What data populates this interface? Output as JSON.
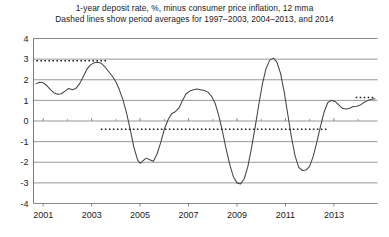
{
  "chart_data": {
    "type": "line",
    "title": "1-year deposit rate, %, minus consumer price inflation, 12 mma",
    "subtitle": "Dashed lines show period averages for 1997–2003,  2004–2013,  and 2014",
    "xlabel": "",
    "ylabel": "",
    "xlim": [
      2000.6,
      2014.8
    ],
    "ylim": [
      -4,
      4
    ],
    "grid": true,
    "legend": "none",
    "yticks": [
      "4",
      "3",
      "2",
      "1",
      "0",
      "-1",
      "-2",
      "-3",
      "-4"
    ],
    "ytick_values": [
      4,
      3,
      2,
      1,
      0,
      -1,
      -2,
      -3,
      -4
    ],
    "xticks": [
      "2001",
      "2003",
      "2005",
      "2007",
      "2009",
      "2011",
      "2013"
    ],
    "xtick_values": [
      2001,
      2003,
      2005,
      2007,
      2009,
      2011,
      2013
    ],
    "series": [
      {
        "name": "1-year deposit rate minus CPI inflation, 12 mma",
        "style": "solid",
        "color": "#444444",
        "x": [
          2000.7,
          2000.85,
          2001.0,
          2001.15,
          2001.3,
          2001.45,
          2001.6,
          2001.75,
          2001.9,
          2002.05,
          2002.2,
          2002.35,
          2002.5,
          2002.65,
          2002.8,
          2002.95,
          2003.1,
          2003.25,
          2003.4,
          2003.55,
          2003.7,
          2003.85,
          2004.0,
          2004.15,
          2004.3,
          2004.45,
          2004.6,
          2004.75,
          2004.9,
          2005.0,
          2005.1,
          2005.25,
          2005.4,
          2005.55,
          2005.7,
          2005.85,
          2006.0,
          2006.15,
          2006.3,
          2006.45,
          2006.6,
          2006.75,
          2006.9,
          2007.05,
          2007.2,
          2007.35,
          2007.5,
          2007.65,
          2007.8,
          2007.95,
          2008.1,
          2008.25,
          2008.4,
          2008.55,
          2008.7,
          2008.85,
          2009.0,
          2009.15,
          2009.3,
          2009.45,
          2009.6,
          2009.75,
          2009.9,
          2010.05,
          2010.2,
          2010.35,
          2010.5,
          2010.65,
          2010.8,
          2010.95,
          2011.1,
          2011.25,
          2011.4,
          2011.55,
          2011.7,
          2011.85,
          2012.0,
          2012.15,
          2012.3,
          2012.45,
          2012.6,
          2012.75,
          2012.9,
          2013.05,
          2013.2,
          2013.35,
          2013.5,
          2013.65,
          2013.8,
          2013.95,
          2014.1,
          2014.25,
          2014.4,
          2014.55,
          2014.7
        ],
        "y": [
          1.8,
          1.88,
          1.85,
          1.72,
          1.52,
          1.36,
          1.3,
          1.32,
          1.45,
          1.58,
          1.52,
          1.58,
          1.8,
          2.15,
          2.5,
          2.72,
          2.82,
          2.85,
          2.8,
          2.62,
          2.4,
          2.18,
          1.9,
          1.5,
          1.0,
          0.35,
          -0.45,
          -1.3,
          -1.9,
          -2.05,
          -1.95,
          -1.8,
          -1.88,
          -1.95,
          -1.6,
          -1.05,
          -0.4,
          0.05,
          0.35,
          0.45,
          0.62,
          1.0,
          1.32,
          1.45,
          1.52,
          1.55,
          1.52,
          1.48,
          1.4,
          1.2,
          0.85,
          0.25,
          -0.5,
          -1.35,
          -2.1,
          -2.7,
          -3.0,
          -3.05,
          -2.8,
          -2.2,
          -1.3,
          -0.3,
          0.8,
          1.8,
          2.55,
          2.95,
          3.05,
          2.85,
          2.3,
          1.4,
          0.3,
          -0.8,
          -1.7,
          -2.25,
          -2.4,
          -2.38,
          -2.2,
          -1.7,
          -1.0,
          -0.25,
          0.45,
          0.9,
          1.0,
          0.95,
          0.78,
          0.62,
          0.58,
          0.62,
          0.7,
          0.72,
          0.78,
          0.9,
          1.0,
          1.05,
          1.08
        ]
      }
    ],
    "reference_lines": [
      {
        "name": "period-average-1997-2003",
        "style": "dotted",
        "value": 2.92,
        "x_start": 2000.72,
        "x_end": 2003.68,
        "color": "#222222"
      },
      {
        "name": "period-average-2004-2013",
        "style": "dotted",
        "value": -0.4,
        "x_start": 2003.38,
        "x_end": 2012.7,
        "color": "#222222"
      },
      {
        "name": "period-average-2014",
        "style": "dotted",
        "value": 1.14,
        "x_start": 2013.9,
        "x_end": 2014.72,
        "color": "#222222"
      }
    ]
  }
}
